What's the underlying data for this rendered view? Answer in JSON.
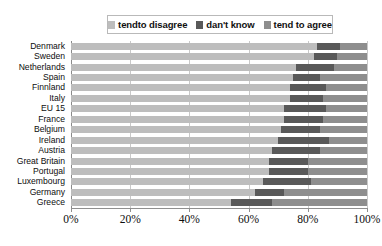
{
  "chart_data": {
    "type": "bar",
    "orientation": "horizontal",
    "stacked": true,
    "normalized_percent": true,
    "title": "",
    "xlabel": "",
    "ylabel": "",
    "xlim": [
      0,
      100
    ],
    "xticks": [
      0,
      20,
      40,
      60,
      80,
      100
    ],
    "xtick_labels": [
      "0%",
      "20%",
      "40%",
      "60%",
      "80%",
      "100%"
    ],
    "grid": true,
    "grid_axis": "x",
    "legend_position": "top-center",
    "categories": [
      "Denmark",
      "Sweden",
      "Netherlands",
      "Spain",
      "Finnland",
      "Italy",
      "EU 15",
      "France",
      "Belgium",
      "Ireland",
      "Austria",
      "Great Britain",
      "Portugal",
      "Luxembourg",
      "Germany",
      "Greece"
    ],
    "series": [
      {
        "name": "tendto disagree",
        "color": "#bdbdbd",
        "values": [
          83,
          82,
          76,
          75,
          74,
          74,
          72,
          72,
          71,
          70,
          68,
          67,
          67,
          65,
          62,
          54
        ]
      },
      {
        "name": "dan't know",
        "color": "#595959",
        "values": [
          8,
          8,
          13,
          9,
          12,
          11,
          14,
          13,
          13,
          17,
          16,
          13,
          13,
          16,
          10,
          14
        ]
      },
      {
        "name": "tend to agree",
        "color": "#8e8e8e",
        "values": [
          9,
          10,
          11,
          16,
          14,
          15,
          14,
          15,
          16,
          13,
          16,
          20,
          20,
          19,
          28,
          32
        ]
      }
    ]
  },
  "legend": {
    "items": [
      {
        "label": "tendto disagree",
        "color": "#bdbdbd"
      },
      {
        "label": "dan't know",
        "color": "#595959"
      },
      {
        "label": "tend to agree",
        "color": "#8e8e8e"
      }
    ]
  },
  "colors": {
    "disagree": "#bdbdbd",
    "dont_know": "#595959",
    "agree": "#8e8e8e",
    "grid": "#c9c9c9",
    "axis": "#8f8f8f",
    "text": "#0d0d0d",
    "legend_border": "#b9b9b9",
    "background": "#ffffff"
  }
}
